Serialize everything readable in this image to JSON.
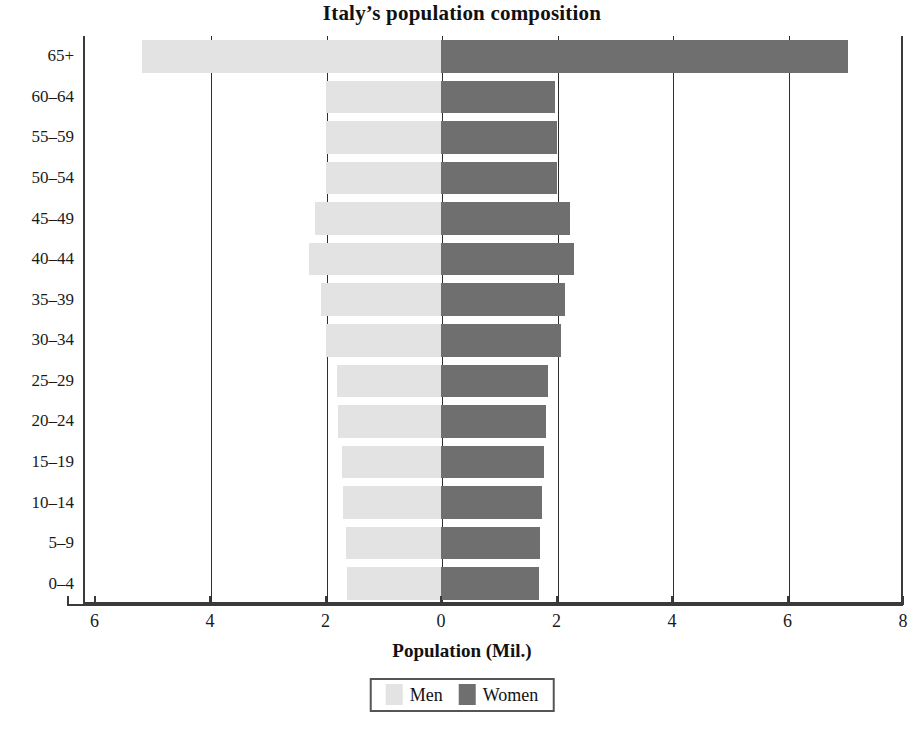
{
  "chart_data": {
    "type": "bar",
    "subtype": "population-pyramid",
    "title": "Italy’s  population composition",
    "xlabel": "Population (Mil.)",
    "ylabel": "",
    "categories": [
      "65+",
      "60–64",
      "55–59",
      "50–54",
      "45–49",
      "40–44",
      "35–39",
      "30–34",
      "25–29",
      "20–24",
      "15–19",
      "10–14",
      "5–9",
      "0–4"
    ],
    "series": [
      {
        "name": "Men",
        "color": "#e3e3e3",
        "direction": "left",
        "values": [
          5.18,
          2.0,
          2.0,
          2.0,
          2.18,
          2.28,
          2.08,
          2.0,
          1.8,
          1.78,
          1.72,
          1.7,
          1.65,
          1.62
        ]
      },
      {
        "name": "Women",
        "color": "#6f6f6f",
        "direction": "right",
        "values": [
          7.05,
          1.98,
          2.0,
          2.0,
          2.23,
          2.3,
          2.15,
          2.08,
          1.85,
          1.82,
          1.78,
          1.75,
          1.72,
          1.7
        ]
      }
    ],
    "xlim": [
      -6.2,
      8.0
    ],
    "x_tick_values": [
      -6,
      -4,
      -2,
      0,
      2,
      4,
      6,
      8
    ],
    "x_tick_labels": [
      "6",
      "4",
      "2",
      "0",
      "2",
      "4",
      "6",
      "8"
    ],
    "grid": true,
    "gridline_values": [
      -4,
      -2,
      0,
      2,
      4,
      6
    ],
    "legend_position": "bottom-center"
  },
  "legend": {
    "items": [
      {
        "label": "Men",
        "color": "#e3e3e3",
        "swatch_name": "men-swatch"
      },
      {
        "label": "Women",
        "color": "#6f6f6f",
        "swatch_name": "women-swatch"
      }
    ]
  },
  "caption": {
    "text": ""
  },
  "colors": {
    "men": "#e3e3e3",
    "women": "#6f6f6f",
    "axis": "#3a3a3a",
    "text": "#1a1a1a",
    "background": "#ffffff"
  }
}
